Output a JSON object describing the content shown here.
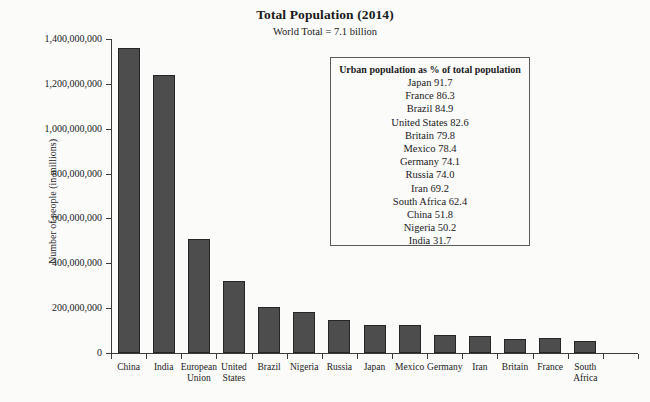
{
  "chart_data": {
    "type": "bar",
    "title": "Total Population (2014)",
    "subtitle": "World Total = 7.1 billion",
    "xlabel": "",
    "ylabel": "Number of people (in millions)",
    "ylim": [
      0,
      1400000000
    ],
    "grid": false,
    "legend_position": "inside-upper-right",
    "categories": [
      "China",
      "India",
      "European\nUnion",
      "United\nStates",
      "Brazil",
      "Nigeria",
      "Russia",
      "Japan",
      "Mexico",
      "Germany",
      "Iran",
      "Britain",
      "France",
      "South\nAfrica"
    ],
    "values": [
      1360000000,
      1240000000,
      510000000,
      320000000,
      205000000,
      182000000,
      146000000,
      127000000,
      125000000,
      81000000,
      78000000,
      64000000,
      66000000,
      54000000
    ],
    "ytick_labels": [
      "1,400,000,000",
      "1,200,000,000",
      "1,000,000,000",
      "800,000,000",
      "600,000,000",
      "400,000,000",
      "200,000,000",
      "0"
    ],
    "ytick_values": [
      1400000000,
      1200000000,
      1000000000,
      800000000,
      600000000,
      400000000,
      200000000,
      0
    ],
    "bar_color": "#4d4d4d",
    "bar_edge_color": "#262626"
  },
  "legend": {
    "heading": "Urban population as % of total population",
    "unit": "%",
    "rows": [
      {
        "country": "Japan",
        "value": "91.7",
        "text": "Japan 91.7"
      },
      {
        "country": "France",
        "value": "86.3",
        "text": "France 86.3"
      },
      {
        "country": "Brazil",
        "value": "84.9",
        "text": "Brazil 84.9"
      },
      {
        "country": "United States",
        "value": "82.6",
        "text": "United States 82.6"
      },
      {
        "country": "Britain",
        "value": "79.8",
        "text": "Britain 79.8"
      },
      {
        "country": "Mexico",
        "value": "78.4",
        "text": "Mexico 78.4"
      },
      {
        "country": "Germany",
        "value": "74.1",
        "text": "Germany 74.1"
      },
      {
        "country": "Russia",
        "value": "74.0",
        "text": "Russia 74.0"
      },
      {
        "country": "Iran",
        "value": "69.2",
        "text": "Iran 69.2"
      },
      {
        "country": "South Africa",
        "value": "62.4",
        "text": "South Africa 62.4"
      },
      {
        "country": "China",
        "value": "51.8",
        "text": "China 51.8"
      },
      {
        "country": "Nigeria",
        "value": "50.2",
        "text": "Nigeria 50.2"
      },
      {
        "country": "India",
        "value": "31.7",
        "text": "India 31.7"
      }
    ]
  }
}
